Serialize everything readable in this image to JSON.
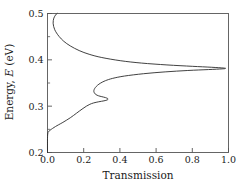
{
  "chart_data": {
    "type": "line",
    "title": "",
    "xlabel": "Transmission",
    "ylabel": "Energy, E (eV)",
    "ylabel_parts": {
      "prefix": "Energy, ",
      "symbol": "E",
      "suffix": " (eV)"
    },
    "xlim": [
      0.0,
      1.0
    ],
    "ylim": [
      0.2,
      0.5
    ],
    "grid": false,
    "legend": null,
    "orientation": "horizontal-value-vertical-energy",
    "xticks": [
      0.0,
      0.2,
      0.4,
      0.6,
      0.8,
      1.0
    ],
    "xticklabels": [
      "0.0",
      "0.2",
      "0.4",
      "0.6",
      "0.8",
      "1.0"
    ],
    "yticks": [
      0.2,
      0.3,
      0.4,
      0.5
    ],
    "yticklabels": [
      "0.2",
      "0.3",
      "0.4",
      "0.5"
    ],
    "yminorticks": [
      0.25,
      0.35,
      0.45
    ],
    "xminorticks": [],
    "line_color": "#2b2b2b",
    "series": [
      {
        "name": "Transmission coefficient",
        "x_is_value": true,
        "resonances": [
          {
            "energy": 0.381,
            "peak_transmission": 0.98,
            "halfwidth": 0.0085
          },
          {
            "energy": 0.32,
            "peak_transmission": 0.33,
            "halfwidth": 0.0042
          }
        ],
        "points": [
          {
            "E": 0.2,
            "T": 0.0
          },
          {
            "E": 0.23,
            "T": 0.0
          },
          {
            "E": 0.242,
            "T": 0.002
          },
          {
            "E": 0.245,
            "T": 0.006
          },
          {
            "E": 0.248,
            "T": 0.014
          },
          {
            "E": 0.252,
            "T": 0.028
          },
          {
            "E": 0.256,
            "T": 0.044
          },
          {
            "E": 0.26,
            "T": 0.062
          },
          {
            "E": 0.265,
            "T": 0.085
          },
          {
            "E": 0.27,
            "T": 0.106
          },
          {
            "E": 0.275,
            "T": 0.126
          },
          {
            "E": 0.28,
            "T": 0.144
          },
          {
            "E": 0.285,
            "T": 0.161
          },
          {
            "E": 0.29,
            "T": 0.178
          },
          {
            "E": 0.295,
            "T": 0.196
          },
          {
            "E": 0.3,
            "T": 0.215
          },
          {
            "E": 0.304,
            "T": 0.234
          },
          {
            "E": 0.307,
            "T": 0.255
          },
          {
            "E": 0.3095,
            "T": 0.283
          },
          {
            "E": 0.3115,
            "T": 0.312
          },
          {
            "E": 0.3135,
            "T": 0.33
          },
          {
            "E": 0.316,
            "T": 0.334
          },
          {
            "E": 0.3185,
            "T": 0.32
          },
          {
            "E": 0.3205,
            "T": 0.3
          },
          {
            "E": 0.3225,
            "T": 0.281
          },
          {
            "E": 0.325,
            "T": 0.268
          },
          {
            "E": 0.328,
            "T": 0.26
          },
          {
            "E": 0.332,
            "T": 0.256
          },
          {
            "E": 0.336,
            "T": 0.258
          },
          {
            "E": 0.34,
            "T": 0.264
          },
          {
            "E": 0.345,
            "T": 0.276
          },
          {
            "E": 0.35,
            "T": 0.294
          },
          {
            "E": 0.355,
            "T": 0.32
          },
          {
            "E": 0.36,
            "T": 0.36
          },
          {
            "E": 0.365,
            "T": 0.425
          },
          {
            "E": 0.37,
            "T": 0.53
          },
          {
            "E": 0.374,
            "T": 0.65
          },
          {
            "E": 0.377,
            "T": 0.775
          },
          {
            "E": 0.379,
            "T": 0.89
          },
          {
            "E": 0.3805,
            "T": 0.965
          },
          {
            "E": 0.3812,
            "T": 0.982
          },
          {
            "E": 0.3822,
            "T": 0.975
          },
          {
            "E": 0.384,
            "T": 0.905
          },
          {
            "E": 0.386,
            "T": 0.8
          },
          {
            "E": 0.389,
            "T": 0.66
          },
          {
            "E": 0.393,
            "T": 0.52
          },
          {
            "E": 0.398,
            "T": 0.405
          },
          {
            "E": 0.405,
            "T": 0.3
          },
          {
            "E": 0.412,
            "T": 0.23
          },
          {
            "E": 0.42,
            "T": 0.175
          },
          {
            "E": 0.43,
            "T": 0.126
          },
          {
            "E": 0.44,
            "T": 0.09
          },
          {
            "E": 0.45,
            "T": 0.065
          },
          {
            "E": 0.458,
            "T": 0.05
          },
          {
            "E": 0.465,
            "T": 0.04
          },
          {
            "E": 0.472,
            "T": 0.034
          },
          {
            "E": 0.479,
            "T": 0.031
          },
          {
            "E": 0.485,
            "T": 0.032
          },
          {
            "E": 0.49,
            "T": 0.035
          },
          {
            "E": 0.494,
            "T": 0.04
          },
          {
            "E": 0.497,
            "T": 0.045
          },
          {
            "E": 0.499,
            "T": 0.05
          },
          {
            "E": 0.5,
            "T": 0.053
          }
        ]
      }
    ]
  }
}
